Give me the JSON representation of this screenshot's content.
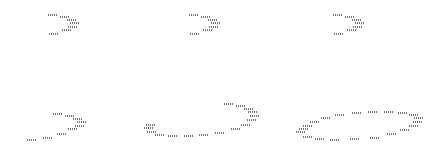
{
  "figure": {
    "mark_color": "#5a5a5a",
    "background": "#ffffff",
    "panels": [
      {
        "id": "p1",
        "segments": [
          [
            48,
            14
          ],
          [
            60,
            16
          ],
          [
            67,
            19
          ],
          [
            70,
            22
          ],
          [
            68,
            26
          ],
          [
            62,
            29
          ],
          [
            49,
            33
          ]
        ]
      },
      {
        "id": "p2",
        "segments": [
          [
            189,
            14
          ],
          [
            201,
            16
          ],
          [
            208,
            19
          ],
          [
            211,
            22
          ],
          [
            209,
            26
          ],
          [
            203,
            29
          ],
          [
            190,
            33
          ]
        ]
      },
      {
        "id": "p3",
        "segments": [
          [
            333,
            14
          ],
          [
            345,
            16
          ],
          [
            352,
            19
          ],
          [
            355,
            22
          ],
          [
            353,
            26
          ],
          [
            347,
            29
          ],
          [
            334,
            33
          ]
        ]
      },
      {
        "id": "p4",
        "segments": [
          [
            53,
            113
          ],
          [
            65,
            115
          ],
          [
            73,
            118
          ],
          [
            77,
            121
          ],
          [
            75,
            125
          ],
          [
            68,
            128
          ],
          [
            57,
            133
          ],
          [
            43,
            137
          ],
          [
            27,
            139
          ]
        ]
      },
      {
        "id": "p5",
        "segments": [
          [
            146,
            124
          ],
          [
            144,
            127
          ],
          [
            147,
            131
          ],
          [
            155,
            134
          ],
          [
            168,
            135
          ],
          [
            184,
            135
          ],
          [
            199,
            134
          ],
          [
            215,
            132
          ],
          [
            231,
            128
          ],
          [
            241,
            124
          ],
          [
            247,
            119
          ],
          [
            250,
            115
          ],
          [
            248,
            111
          ],
          [
            244,
            108
          ],
          [
            236,
            105
          ],
          [
            224,
            103
          ]
        ]
      },
      {
        "id": "p6",
        "segments": [
          [
            296,
            131
          ],
          [
            299,
            128
          ],
          [
            303,
            125
          ],
          [
            310,
            121
          ],
          [
            321,
            117
          ],
          [
            335,
            114
          ],
          [
            352,
            112
          ],
          [
            368,
            111
          ],
          [
            384,
            111
          ],
          [
            398,
            112
          ],
          [
            409,
            114
          ],
          [
            414,
            117
          ],
          [
            413,
            121
          ],
          [
            409,
            125
          ],
          [
            400,
            129
          ],
          [
            387,
            133
          ],
          [
            370,
            137
          ],
          [
            350,
            138
          ],
          [
            330,
            139
          ],
          [
            315,
            138
          ],
          [
            303,
            136
          ]
        ]
      }
    ]
  }
}
